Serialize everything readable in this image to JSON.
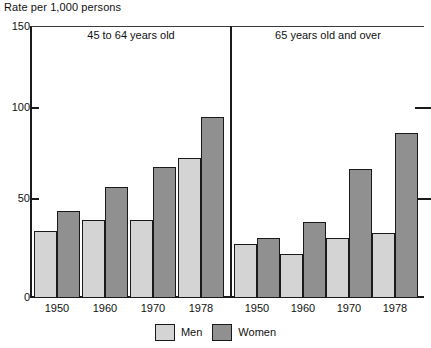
{
  "chart_data": {
    "type": "bar",
    "title": "",
    "ylabel": "Rate per 1,000 persons",
    "xlabel": "",
    "ylim": [
      0,
      150
    ],
    "yticks": [
      0,
      50,
      100,
      150
    ],
    "ytick_labels": [
      "0",
      "50",
      "100",
      "150"
    ],
    "grid": false,
    "legend_position": "bottom-center",
    "categories": [
      "1950",
      "1960",
      "1970",
      "1978"
    ],
    "panels": [
      {
        "name": "45 to 64 years old",
        "categories": [
          "1950",
          "1960",
          "1970",
          "1978"
        ],
        "series": [
          {
            "name": "Men",
            "values": [
              37,
              43,
              43,
              77
            ]
          },
          {
            "name": "Women",
            "values": [
              48,
              61,
              72,
              100
            ]
          }
        ]
      },
      {
        "name": "65 years old and over",
        "categories": [
          "1950",
          "1960",
          "1970",
          "1978"
        ],
        "series": [
          {
            "name": "Men",
            "values": [
              30,
              24,
              33,
              36
            ]
          },
          {
            "name": "Women",
            "values": [
              33,
              42,
              71,
              91
            ]
          }
        ]
      }
    ],
    "series_colors": {
      "Men": "#d4d4d4",
      "Women": "#909090"
    }
  },
  "axis": {
    "y_title": "Rate per 1,000 persons",
    "y_tick_150": "150",
    "y_tick_100": "100",
    "y_tick_50": "50",
    "y_tick_0": "0"
  },
  "panels": {
    "left_title": "45 to 64 years old",
    "right_title": "65 years old and over"
  },
  "xlabels": {
    "left": [
      "1950",
      "1960",
      "1970",
      "1978"
    ],
    "right": [
      "1950",
      "1960",
      "1970",
      "1978"
    ]
  },
  "legend": {
    "items": [
      {
        "label": "Men",
        "color": "#d4d4d4"
      },
      {
        "label": "Women",
        "color": "#909090"
      }
    ]
  }
}
